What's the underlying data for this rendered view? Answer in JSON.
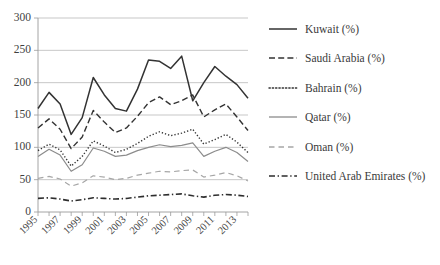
{
  "chart_data": {
    "type": "line",
    "title": "",
    "xlabel": "",
    "ylabel": "",
    "ylim": [
      0,
      300
    ],
    "ytick_step": 50,
    "yticks": [
      "0",
      "50",
      "100",
      "150",
      "200",
      "250",
      "300"
    ],
    "grid": "horizontal",
    "legend_position": "right",
    "x": [
      1995,
      1996,
      1997,
      1998,
      1999,
      2000,
      2001,
      2002,
      2003,
      2004,
      2005,
      2006,
      2007,
      2008,
      2009,
      2010,
      2011,
      2012,
      2013,
      2014
    ],
    "xtick_labels": [
      "1995",
      "1997",
      "1999",
      "2001",
      "2003",
      "2005",
      "2007",
      "2009",
      "2011",
      "2013"
    ],
    "series": [
      {
        "name": "Kuwait (%)",
        "style": "solid",
        "color": "#333333",
        "width": 1.5,
        "values": [
          160,
          185,
          167,
          120,
          146,
          208,
          181,
          160,
          156,
          190,
          235,
          233,
          222,
          241,
          172,
          200,
          225,
          210,
          197,
          176
        ]
      },
      {
        "name": "Saudi Arabia (%)",
        "style": "dashed",
        "color": "#333333",
        "width": 1.4,
        "values": [
          130,
          144,
          128,
          98,
          116,
          157,
          139,
          123,
          130,
          148,
          169,
          178,
          166,
          172,
          181,
          147,
          158,
          167,
          147,
          126
        ]
      },
      {
        "name": "Bahrain (%)",
        "style": "dotted",
        "color": "#333333",
        "width": 1.4,
        "values": [
          95,
          105,
          96,
          71,
          86,
          110,
          102,
          92,
          97,
          106,
          117,
          124,
          118,
          122,
          128,
          105,
          112,
          120,
          108,
          92
        ]
      },
      {
        "name": "Qatar (%)",
        "style": "solid",
        "color": "#8c8c8c",
        "width": 1.2,
        "values": [
          86,
          97,
          88,
          63,
          73,
          99,
          94,
          86,
          88,
          95,
          100,
          104,
          101,
          103,
          107,
          86,
          94,
          100,
          92,
          78
        ]
      },
      {
        "name": "Oman (%)",
        "style": "longdash",
        "color": "#a6a6a6",
        "width": 1.2,
        "values": [
          52,
          55,
          51,
          40,
          45,
          56,
          54,
          50,
          52,
          57,
          60,
          63,
          62,
          64,
          65,
          54,
          57,
          61,
          56,
          48
        ]
      },
      {
        "name": "United Arab Emirates (%)",
        "style": "dashdot",
        "color": "#2d2d2d",
        "width": 1.6,
        "values": [
          21,
          22,
          20,
          17,
          19,
          22,
          21,
          20,
          21,
          23,
          25,
          26,
          27,
          28,
          25,
          23,
          26,
          27,
          26,
          24
        ]
      }
    ]
  },
  "legend": {
    "items": [
      {
        "label": "Kuwait (%)"
      },
      {
        "label": "Saudi Arabia (%)"
      },
      {
        "label": "Bahrain (%)"
      },
      {
        "label": "Qatar (%)"
      },
      {
        "label": "Oman (%)"
      },
      {
        "label": "United Arab Emirates (%)"
      }
    ]
  }
}
